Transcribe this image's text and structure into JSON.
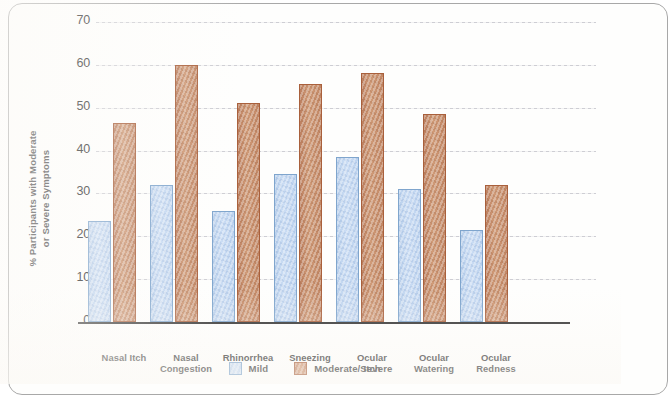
{
  "chart_data": {
    "type": "bar",
    "title": "",
    "xlabel": "",
    "ylabel": "% Participants with Moderate or Severe Symptoms",
    "ylabel_lines": [
      "% Participants with Moderate",
      "or Severe Symptoms"
    ],
    "ylim": [
      0,
      70
    ],
    "ytick_labels": [
      "70",
      "60",
      "50",
      "40",
      "30",
      "20",
      "10",
      "0"
    ],
    "ytick_values": [
      70,
      60,
      50,
      40,
      30,
      20,
      10,
      0
    ],
    "grid": true,
    "grid_axis": "y",
    "legend_position": "bottom",
    "categories": [
      "Nasal Itch",
      "Nasal Congestion",
      "Rhinorrhea",
      "Sneezing",
      "Ocular Itch",
      "Ocular Watering",
      "Ocular Redness"
    ],
    "category_lines": [
      [
        "Nasal Itch"
      ],
      [
        "Nasal",
        "Congestion"
      ],
      [
        "Rhinorrhea"
      ],
      [
        "Sneezing"
      ],
      [
        "Ocular",
        "Itch"
      ],
      [
        "Ocular",
        "Watering"
      ],
      [
        "Ocular",
        "Redness"
      ]
    ],
    "series": [
      {
        "name": "Mild",
        "color": "#c5d9f1",
        "border_color": "#7fa5cd",
        "values": [
          23.5,
          32.0,
          26.0,
          34.5,
          38.5,
          31.0,
          21.5
        ]
      },
      {
        "name": "Moderate/Severe",
        "color": "#c4855f",
        "border_color": "#a9603c",
        "values": [
          46.5,
          60.0,
          51.0,
          55.5,
          58.0,
          48.5,
          32.0
        ]
      }
    ]
  },
  "frame": {
    "border_color": "#a8a8a8",
    "background_color": "#fefefd"
  }
}
